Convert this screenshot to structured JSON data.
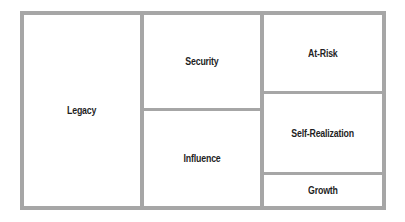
{
  "diagram": {
    "type": "treemap",
    "border_color": "#a6a6a6",
    "cells": [
      {
        "label": "Legacy"
      },
      {
        "label": "Security"
      },
      {
        "label": "Influence"
      },
      {
        "label": "At-Risk"
      },
      {
        "label": "Self-Realization"
      },
      {
        "label": "Growth"
      }
    ]
  }
}
